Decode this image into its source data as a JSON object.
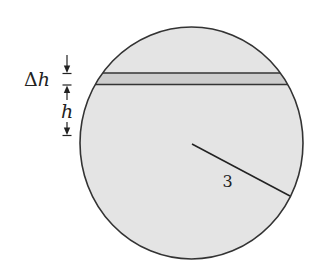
{
  "diagram": {
    "type": "sphere-cross-section",
    "colors": {
      "background": "#ffffff",
      "sphere_fill": "#e4e4e4",
      "slab_fill": "#cdcdcd",
      "outline": "#333333",
      "text": "#222222"
    },
    "labels": {
      "delta_h": {
        "delta": "Δ",
        "var": "h"
      },
      "h": "h",
      "radius": "3"
    },
    "sphere": {
      "cx": 191.5,
      "cy": 143,
      "rx": 111.5,
      "ry": 116
    },
    "slab": {
      "y_top": 73,
      "y_bottom": 84.5
    },
    "radius_line": {
      "x1": 192,
      "y1": 144,
      "x2": 290,
      "y2": 196
    },
    "dimension_markers": {
      "x": 67,
      "delta_h_top_y": 73.5,
      "delta_h_bottom_y": 85,
      "h_bottom_y": 135
    }
  }
}
